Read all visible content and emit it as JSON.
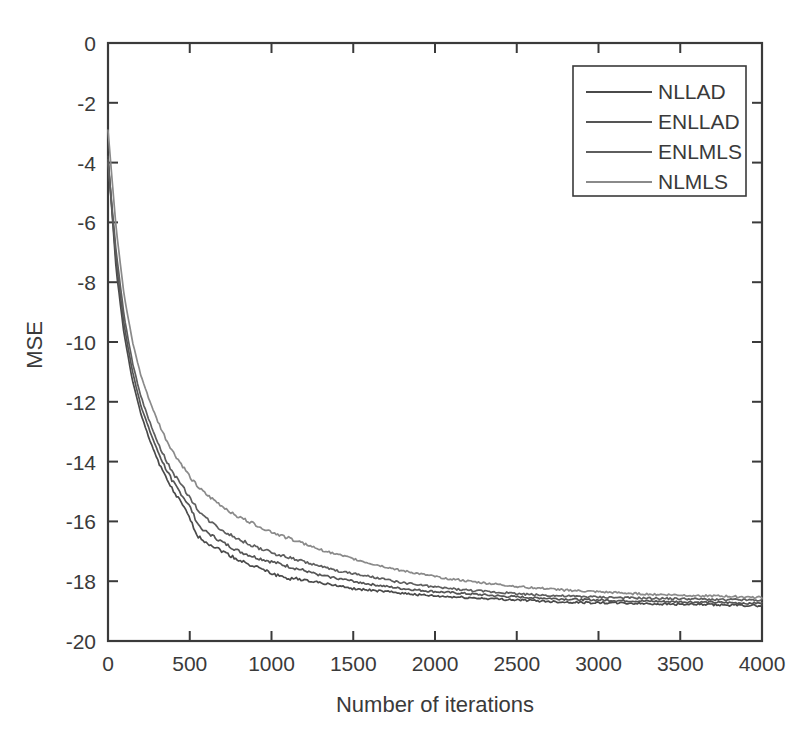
{
  "chart_data": {
    "type": "line",
    "title": "",
    "xlabel": "Number of iterations",
    "ylabel": "MSE",
    "xlim": [
      0,
      4000
    ],
    "ylim": [
      -20,
      0
    ],
    "xticks": [
      0,
      500,
      1000,
      1500,
      2000,
      2500,
      3000,
      3500,
      4000
    ],
    "yticks": [
      0,
      -2,
      -4,
      -6,
      -8,
      -10,
      -12,
      -14,
      -16,
      -18,
      -20
    ],
    "xtick_labels": [
      "0",
      "500",
      "1000",
      "1500",
      "2000",
      "2500",
      "3000",
      "3500",
      "4000"
    ],
    "ytick_labels": [
      "0",
      "-2",
      "-4",
      "-6",
      "-8",
      "-10",
      "-12",
      "-14",
      "-16",
      "-18",
      "-20"
    ],
    "grid": false,
    "legend_position": "upper right",
    "x": [
      0,
      50,
      100,
      150,
      200,
      250,
      300,
      350,
      400,
      450,
      500,
      550,
      600,
      700,
      800,
      900,
      1000,
      1100,
      1200,
      1300,
      1400,
      1500,
      1600,
      1800,
      2000,
      2200,
      2400,
      2600,
      2800,
      3000,
      3200,
      3400,
      3600,
      3800,
      4000
    ],
    "series": [
      {
        "name": "NLLAD",
        "color": "#4a4a4a",
        "values": [
          -3.8,
          -7.6,
          -9.8,
          -11.3,
          -12.4,
          -13.2,
          -13.9,
          -14.5,
          -15.0,
          -15.4,
          -15.9,
          -16.5,
          -16.7,
          -17.0,
          -17.3,
          -17.5,
          -17.75,
          -17.9,
          -17.95,
          -18.05,
          -18.15,
          -18.25,
          -18.3,
          -18.4,
          -18.5,
          -18.55,
          -18.6,
          -18.65,
          -18.7,
          -18.72,
          -18.74,
          -18.76,
          -18.78,
          -18.8,
          -18.82
        ]
      },
      {
        "name": "ENLLAD",
        "color": "#555555",
        "values": [
          -3.9,
          -7.3,
          -9.5,
          -11.0,
          -12.1,
          -12.9,
          -13.6,
          -14.2,
          -14.7,
          -15.1,
          -15.5,
          -16.1,
          -16.35,
          -16.7,
          -17.0,
          -17.2,
          -17.35,
          -17.5,
          -17.65,
          -17.8,
          -17.9,
          -18.0,
          -18.1,
          -18.25,
          -18.35,
          -18.42,
          -18.5,
          -18.55,
          -18.6,
          -18.63,
          -18.66,
          -18.68,
          -18.7,
          -18.72,
          -18.74
        ]
      },
      {
        "name": "ENLMLS",
        "color": "#5e5e5e",
        "values": [
          -4.0,
          -7.0,
          -9.2,
          -10.7,
          -11.8,
          -12.6,
          -13.3,
          -13.9,
          -14.4,
          -14.8,
          -15.2,
          -15.6,
          -15.9,
          -16.3,
          -16.6,
          -16.85,
          -17.05,
          -17.2,
          -17.35,
          -17.5,
          -17.65,
          -17.75,
          -17.85,
          -18.05,
          -18.2,
          -18.3,
          -18.38,
          -18.45,
          -18.5,
          -18.53,
          -18.56,
          -18.58,
          -18.6,
          -18.62,
          -18.64
        ]
      },
      {
        "name": "NLMLS",
        "color": "#8a8a8a",
        "values": [
          -2.9,
          -6.2,
          -8.5,
          -10.0,
          -11.1,
          -11.9,
          -12.6,
          -13.2,
          -13.7,
          -14.1,
          -14.5,
          -14.85,
          -15.1,
          -15.5,
          -15.85,
          -16.1,
          -16.35,
          -16.55,
          -16.75,
          -16.95,
          -17.1,
          -17.25,
          -17.4,
          -17.65,
          -17.85,
          -18.0,
          -18.12,
          -18.22,
          -18.3,
          -18.36,
          -18.41,
          -18.45,
          -18.48,
          -18.51,
          -18.54
        ]
      }
    ]
  },
  "axes": {
    "line_color": "#3a3a3a",
    "background": "#ffffff"
  },
  "legend": {
    "items": [
      {
        "label": "NLLAD"
      },
      {
        "label": "ENLLAD"
      },
      {
        "label": "ENLMLS"
      },
      {
        "label": "NLMLS"
      }
    ]
  }
}
